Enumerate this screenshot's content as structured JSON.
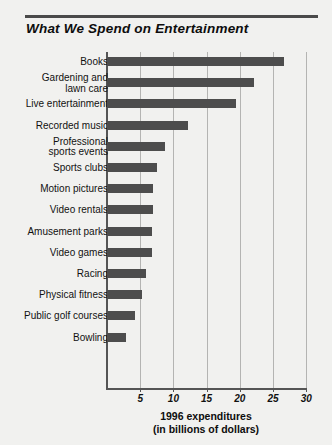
{
  "header": {
    "title": "What We Spend on Entertainment",
    "rule_color": "#4a4a4a"
  },
  "axis_caption": {
    "line1": "1996 expenditures",
    "line2": "(in billions of dollars)"
  },
  "style": {
    "bar_color": "#4d4d4d",
    "grid_color": "#b4b4b2",
    "axis_color": "#555555",
    "background": "#f1f1ef"
  },
  "chart_data": {
    "type": "bar",
    "orientation": "horizontal",
    "title": "What We Spend on Entertainment",
    "xlabel": "1996 expenditures (in billions of dollars)",
    "ylabel": "",
    "xlim": [
      0,
      31
    ],
    "xticks": [
      5,
      10,
      15,
      20,
      25,
      30
    ],
    "xtick_labels": [
      "5",
      "10",
      "15",
      "20",
      "25",
      "30"
    ],
    "grid": true,
    "grid_axis": "x",
    "legend": false,
    "units": "billions of dollars",
    "categories": [
      "Books",
      "Gardening and lawn care",
      "Live entertainment",
      "Recorded music",
      "Professional sports events",
      "Sports clubs",
      "Motion pictures",
      "Video rentals",
      "Amusement parks",
      "Video games",
      "Racing",
      "Physical fitness",
      "Public golf courses",
      "Bowling"
    ],
    "category_lines": [
      [
        "Books"
      ],
      [
        "Gardening and",
        "lawn care"
      ],
      [
        "Live entertainment"
      ],
      [
        "Recorded music"
      ],
      [
        "Professional",
        "sports events"
      ],
      [
        "Sports clubs"
      ],
      [
        "Motion pictures"
      ],
      [
        "Video rentals"
      ],
      [
        "Amusement parks"
      ],
      [
        "Video games"
      ],
      [
        "Racing"
      ],
      [
        "Physical fitness"
      ],
      [
        "Public golf courses"
      ],
      [
        "Bowling"
      ]
    ],
    "values": [
      26.6,
      22.2,
      19.5,
      12.2,
      8.7,
      7.6,
      6.9,
      6.9,
      6.8,
      6.8,
      5.9,
      5.3,
      4.2,
      2.9
    ]
  }
}
